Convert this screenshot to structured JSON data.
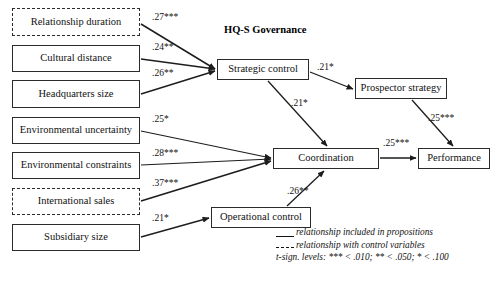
{
  "figure": {
    "title": "HQ-S Governance",
    "width": 504,
    "height": 283,
    "background": "#ffffff",
    "line_color": "#2b2b2b"
  },
  "nodes": [
    {
      "id": "relationship-duration",
      "label": "Relationship duration",
      "border": "dashed",
      "x": 12,
      "y": 8,
      "w": 128,
      "h": 28
    },
    {
      "id": "cultural-distance",
      "label": "Cultural distance",
      "border": "solid",
      "x": 12,
      "y": 45,
      "w": 128,
      "h": 27
    },
    {
      "id": "headquarters-size",
      "label": "Headquarters size",
      "border": "solid",
      "x": 12,
      "y": 80,
      "w": 128,
      "h": 28
    },
    {
      "id": "environmental-uncertainty",
      "label": "Environmental uncertainty",
      "border": "solid",
      "x": 12,
      "y": 117,
      "w": 128,
      "h": 27
    },
    {
      "id": "environmental-constraints",
      "label": "Environmental constraints",
      "border": "solid",
      "x": 12,
      "y": 152,
      "w": 128,
      "h": 27
    },
    {
      "id": "international-sales",
      "label": "International sales",
      "border": "dashed",
      "x": 12,
      "y": 188,
      "w": 128,
      "h": 27
    },
    {
      "id": "subsidiary-size",
      "label": "Subsidiary size",
      "border": "solid",
      "x": 12,
      "y": 224,
      "w": 128,
      "h": 27
    },
    {
      "id": "strategic-control",
      "label": "Strategic control",
      "border": "solid",
      "x": 217,
      "y": 59,
      "w": 92,
      "h": 21
    },
    {
      "id": "prospector-strategy",
      "label": "Prospector strategy",
      "border": "solid",
      "x": 355,
      "y": 78,
      "w": 92,
      "h": 21
    },
    {
      "id": "coordination",
      "label": "Coordination",
      "border": "solid",
      "x": 273,
      "y": 148,
      "w": 106,
      "h": 21
    },
    {
      "id": "operational-control",
      "label": "Operational control",
      "border": "solid",
      "x": 211,
      "y": 207,
      "w": 100,
      "h": 21
    },
    {
      "id": "performance",
      "label": "Performance",
      "border": "solid",
      "x": 418,
      "y": 148,
      "w": 72,
      "h": 21
    }
  ],
  "edges": [
    {
      "id": "relationship-duration-to-strategic-control",
      "from": "relationship-duration",
      "to": "strategic-control",
      "coefficient": ".27",
      "stars": "***",
      "label": ".27***",
      "style": "solid",
      "lx": 152,
      "ly": 12
    },
    {
      "id": "cultural-distance-to-strategic-control",
      "from": "cultural-distance",
      "to": "strategic-control",
      "coefficient": ".24",
      "stars": "**",
      "label": ".24**",
      "style": "solid",
      "lx": 152,
      "ly": 42
    },
    {
      "id": "headquarters-size-to-strategic-control",
      "from": "headquarters-size",
      "to": "strategic-control",
      "coefficient": ".26",
      "stars": "**",
      "label": ".26**",
      "style": "solid",
      "lx": 152,
      "ly": 68
    },
    {
      "id": "environmental-uncertainty-to-coordination",
      "from": "environmental-uncertainty",
      "to": "coordination",
      "coefficient": ".25",
      "stars": "*",
      "label": ".25*",
      "style": "solid",
      "lx": 152,
      "ly": 114
    },
    {
      "id": "environmental-constraints-to-coordination",
      "from": "environmental-constraints",
      "to": "coordination",
      "coefficient": ".28",
      "stars": "***",
      "label": ".28***",
      "style": "solid",
      "lx": 152,
      "ly": 148
    },
    {
      "id": "international-sales-to-coordination",
      "from": "international-sales",
      "to": "coordination",
      "coefficient": ".37",
      "stars": "***",
      "label": ".37***",
      "style": "solid",
      "lx": 152,
      "ly": 178
    },
    {
      "id": "subsidiary-size-to-operational-control",
      "from": "subsidiary-size",
      "to": "operational-control",
      "coefficient": ".21",
      "stars": "*",
      "label": ".21*",
      "style": "solid",
      "lx": 152,
      "ly": 213
    },
    {
      "id": "strategic-control-to-prospector-strategy",
      "from": "strategic-control",
      "to": "prospector-strategy",
      "coefficient": ".21",
      "stars": "*",
      "label": ".21*",
      "style": "solid",
      "lx": 317,
      "ly": 62
    },
    {
      "id": "strategic-control-to-coordination",
      "from": "strategic-control",
      "to": "coordination",
      "coefficient": ".21",
      "stars": "*",
      "label": ".21*",
      "style": "solid",
      "lx": 291,
      "ly": 98
    },
    {
      "id": "prospector-strategy-to-performance",
      "from": "prospector-strategy",
      "to": "performance",
      "coefficient": ".25",
      "stars": "***",
      "label": ".25***",
      "style": "solid",
      "lx": 428,
      "ly": 113
    },
    {
      "id": "coordination-to-performance",
      "from": "coordination",
      "to": "performance",
      "coefficient": ".25",
      "stars": "***",
      "label": ".25***",
      "style": "solid",
      "lx": 383,
      "ly": 138
    },
    {
      "id": "operational-control-to-coordination",
      "from": "operational-control",
      "to": "coordination",
      "coefficient": ".26",
      "stars": "**",
      "label": ".26**",
      "style": "solid",
      "lx": 287,
      "ly": 186
    }
  ],
  "legend": {
    "line_solid": "relationship included in propositions",
    "line_dashed": "relationship with control variables",
    "significance": "t-sign. levels: *** < .010; ** < .050; * < .100"
  }
}
